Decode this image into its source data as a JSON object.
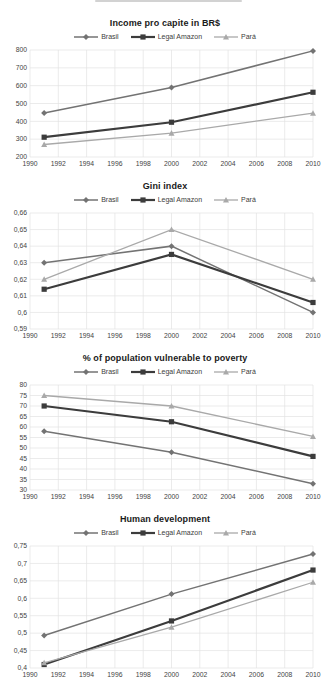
{
  "accent_colors": {
    "grid": "#e3e3e3",
    "tick_text": "#444444",
    "title_text": "#1a1a1a",
    "brasil": "#737373",
    "legal_amazon": "#3c3c3c",
    "para": "#a9a9a9"
  },
  "chart_data": [
    {
      "type": "line",
      "title": "Income pro capite in BR$",
      "x": [
        1991,
        2000,
        2010
      ],
      "x_axis": {
        "min": 1990,
        "max": 2010,
        "step": 2,
        "tick_labels": [
          "1990",
          "1992",
          "1994",
          "1996",
          "1998",
          "2000",
          "2002",
          "2004",
          "2006",
          "2008",
          "2010"
        ]
      },
      "y_axis": {
        "min": 200,
        "max": 800,
        "step": 100,
        "tick_labels": [
          "200",
          "300",
          "400",
          "500",
          "600",
          "700",
          "800"
        ]
      },
      "legend_position": "top",
      "grid": true,
      "series": [
        {
          "name": "Brasil",
          "marker": "diamond",
          "color": "#737373",
          "line_width": 1.5,
          "values": [
            447,
            590,
            795
          ]
        },
        {
          "name": "Legal Amazon",
          "marker": "square",
          "color": "#3c3c3c",
          "line_width": 2.2,
          "values": [
            311,
            395,
            563
          ]
        },
        {
          "name": "Pará",
          "marker": "triangle",
          "color": "#a9a9a9",
          "line_width": 1.3,
          "values": [
            270,
            334,
            446
          ]
        }
      ]
    },
    {
      "type": "line",
      "title": "Gini index",
      "x": [
        1991,
        2000,
        2010
      ],
      "x_axis": {
        "min": 1990,
        "max": 2010,
        "step": 2,
        "tick_labels": [
          "1990",
          "1992",
          "1994",
          "1996",
          "1998",
          "2000",
          "2002",
          "2004",
          "2006",
          "2008",
          "2010"
        ]
      },
      "y_axis": {
        "min": 0.59,
        "max": 0.66,
        "step": 0.01,
        "tick_labels": [
          "0,59",
          "0,6",
          "0,61",
          "0,62",
          "0,63",
          "0,64",
          "0,65",
          "0,66"
        ]
      },
      "legend_position": "top",
      "grid": true,
      "series": [
        {
          "name": "Brasil",
          "marker": "diamond",
          "color": "#737373",
          "line_width": 1.5,
          "values": [
            0.63,
            0.64,
            0.6
          ]
        },
        {
          "name": "Legal Amazon",
          "marker": "square",
          "color": "#3c3c3c",
          "line_width": 2.2,
          "values": [
            0.614,
            0.635,
            0.606
          ]
        },
        {
          "name": "Pará",
          "marker": "triangle",
          "color": "#a9a9a9",
          "line_width": 1.3,
          "values": [
            0.62,
            0.65,
            0.62
          ]
        }
      ]
    },
    {
      "type": "line",
      "title": "% of population vulnerable to poverty",
      "x": [
        1991,
        2000,
        2010
      ],
      "x_axis": {
        "min": 1990,
        "max": 2010,
        "step": 2,
        "tick_labels": [
          "1990",
          "1992",
          "1994",
          "1996",
          "1998",
          "2000",
          "2002",
          "2004",
          "2006",
          "2008",
          "2010"
        ]
      },
      "y_axis": {
        "min": 30,
        "max": 80,
        "step": 5,
        "tick_labels": [
          "30",
          "35",
          "40",
          "45",
          "50",
          "55",
          "60",
          "65",
          "70",
          "75",
          "80"
        ]
      },
      "legend_position": "top",
      "grid": true,
      "series": [
        {
          "name": "Brasil",
          "marker": "diamond",
          "color": "#737373",
          "line_width": 1.5,
          "values": [
            58,
            48,
            33
          ]
        },
        {
          "name": "Legal Amazon",
          "marker": "square",
          "color": "#3c3c3c",
          "line_width": 2.2,
          "values": [
            70,
            62.5,
            46
          ]
        },
        {
          "name": "Pará",
          "marker": "triangle",
          "color": "#a9a9a9",
          "line_width": 1.3,
          "values": [
            75,
            70,
            55.5
          ]
        }
      ]
    },
    {
      "type": "line",
      "title": "Human development",
      "x": [
        1991,
        2000,
        2010
      ],
      "x_axis": {
        "min": 1990,
        "max": 2010,
        "step": 2,
        "tick_labels": [
          "1990",
          "1992",
          "1994",
          "1996",
          "1998",
          "2000",
          "2002",
          "2004",
          "2006",
          "2008",
          "2010"
        ]
      },
      "y_axis": {
        "min": 0.4,
        "max": 0.75,
        "step": 0.05,
        "tick_labels": [
          "0,4",
          "0,45",
          "0,5",
          "0,55",
          "0,6",
          "0,65",
          "0,7",
          "0,75"
        ]
      },
      "legend_position": "top",
      "grid": true,
      "series": [
        {
          "name": "Brasil",
          "marker": "diamond",
          "color": "#737373",
          "line_width": 1.5,
          "values": [
            0.493,
            0.612,
            0.727
          ]
        },
        {
          "name": "Legal Amazon",
          "marker": "square",
          "color": "#3c3c3c",
          "line_width": 2.2,
          "values": [
            0.41,
            0.535,
            0.681
          ]
        },
        {
          "name": "Pará",
          "marker": "triangle",
          "color": "#a9a9a9",
          "line_width": 1.3,
          "values": [
            0.415,
            0.517,
            0.646
          ]
        }
      ]
    }
  ]
}
